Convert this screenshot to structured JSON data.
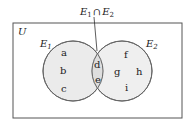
{
  "diagram": {
    "type": "venn",
    "universe_label": "U",
    "intersection_label": {
      "base1": "E",
      "sub1": "1",
      "op": "∩",
      "base2": "E",
      "sub2": "2"
    },
    "sets": [
      {
        "name": "E",
        "sub": "1",
        "only_elements": [
          "a",
          "b",
          "c"
        ]
      },
      {
        "name": "E",
        "sub": "2",
        "only_elements": [
          "f",
          "g",
          "h",
          "i"
        ]
      }
    ],
    "intersection_elements": [
      "d",
      "e"
    ],
    "colors": {
      "fill": "#ebebeb",
      "stroke": "#666666",
      "border": "#555555"
    }
  }
}
